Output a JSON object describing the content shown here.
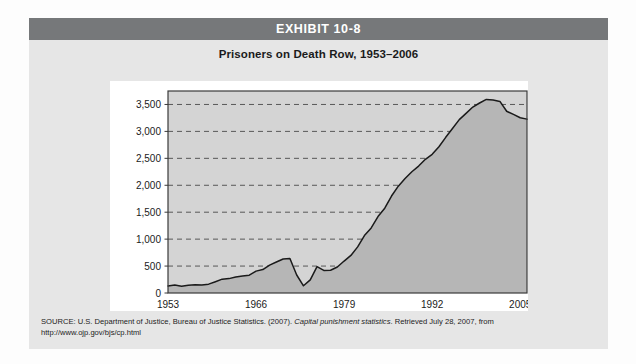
{
  "page": {
    "background_color": "#fdfdfd",
    "card_background_color": "#e6e6e6"
  },
  "banner": {
    "title": "EXHIBIT 10-8",
    "background_color": "#76787a",
    "text_color": "#ffffff"
  },
  "figure": {
    "subtitle": "Prisoners on Death Row, 1953–2006"
  },
  "source": {
    "prefix": "SOURCE: U.S. Department of Justice, Bureau of Justice Statistics. (2007). ",
    "italic_title": "Capital punishment statistics",
    "suffix": ". Retrieved July 28, 2007, from",
    "url": "http://www.ojp.gov/bjs/cp.html"
  },
  "chart_data": {
    "type": "area",
    "title": "Prisoners on Death Row, 1953–2006",
    "xlabel": "",
    "ylabel": "",
    "xlim": [
      1953,
      2006
    ],
    "ylim": [
      0,
      3750
    ],
    "grid": true,
    "grid_style": "dashed-horizontal",
    "legend": "none",
    "area_fill_color": "#b6b6b6",
    "plot_background_color": "#d4d4d4",
    "line_color": "#1a1a1a",
    "axis_color": "#3a3a3a",
    "ytick_labels": [
      "0",
      "500",
      "1,000",
      "1,500",
      "2,000",
      "2,500",
      "3,000",
      "3,500"
    ],
    "yticks": [
      0,
      500,
      1000,
      1500,
      2000,
      2500,
      3000,
      3500
    ],
    "xtick_labels": [
      "1953",
      "1966",
      "1979",
      "1992",
      "2005"
    ],
    "xticks": [
      1953,
      1966,
      1979,
      1992,
      2005
    ],
    "series": [
      {
        "name": "Prisoners on death row",
        "x": [
          1953,
          1954,
          1955,
          1956,
          1957,
          1958,
          1959,
          1960,
          1961,
          1962,
          1963,
          1964,
          1965,
          1966,
          1967,
          1968,
          1969,
          1970,
          1971,
          1972,
          1973,
          1974,
          1975,
          1976,
          1977,
          1978,
          1979,
          1980,
          1981,
          1982,
          1983,
          1984,
          1985,
          1986,
          1987,
          1988,
          1989,
          1990,
          1991,
          1992,
          1993,
          1994,
          1995,
          1996,
          1997,
          1998,
          1999,
          2000,
          2001,
          2002,
          2003,
          2004,
          2005,
          2006
        ],
        "values": [
          131,
          147,
          125,
          146,
          151,
          147,
          164,
          210,
          257,
          267,
          297,
          315,
          331,
          406,
          435,
          517,
          575,
          631,
          642,
          334,
          134,
          244,
          488,
          420,
          423,
          482,
          593,
          697,
          856,
          1066,
          1209,
          1420,
          1575,
          1800,
          1984,
          2124,
          2250,
          2356,
          2482,
          2575,
          2716,
          2890,
          3054,
          3219,
          3335,
          3452,
          3527,
          3593,
          3581,
          3557,
          3374,
          3315,
          3254,
          3228
        ]
      }
    ]
  }
}
